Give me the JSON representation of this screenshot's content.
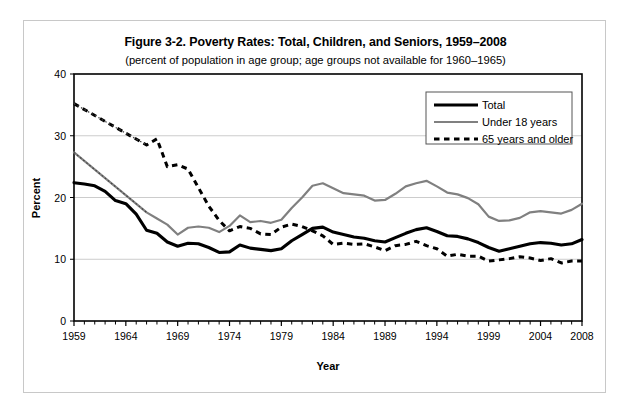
{
  "figure": {
    "title": "Figure 3-2. Poverty Rates: Total, Children, and Seniors, 1959–2008",
    "subtitle": "(percent of population in age group; age groups not available for 1960–1965)"
  },
  "colors": {
    "total": "#000000",
    "under18": "#808080",
    "seniors": "#000000",
    "gridline": "#cccccc",
    "frame": "#000000",
    "outer_border": "#c8c8c8",
    "background": "#ffffff"
  },
  "legend": {
    "position": "top-right",
    "entries": [
      {
        "label": "Total",
        "style": "solid-thick",
        "color": "#000000"
      },
      {
        "label": "Under 18 years",
        "style": "solid",
        "color": "#808080"
      },
      {
        "label": "65 years and older",
        "style": "dashed",
        "color": "#000000"
      }
    ]
  },
  "chart_data": {
    "type": "line",
    "title": "Figure 3-2. Poverty Rates: Total, Children, and Seniors, 1959–2008",
    "subtitle": "(percent of population in age group; age groups not available for 1960–1965)",
    "xlabel": "Year",
    "ylabel": "Percent",
    "xlim": [
      1959,
      2008
    ],
    "ylim": [
      0,
      40
    ],
    "ytick_labels": [
      "0",
      "10",
      "20",
      "30",
      "40"
    ],
    "yticks": [
      0,
      10,
      20,
      30,
      40
    ],
    "xtick_labels": [
      "1959",
      "1964",
      "1969",
      "1974",
      "1979",
      "1984",
      "1989",
      "1994",
      "1999",
      "2004",
      "2008"
    ],
    "xticks": [
      1959,
      1964,
      1969,
      1974,
      1979,
      1984,
      1989,
      1994,
      1999,
      2004,
      2008
    ],
    "xtick_minor_step": 1,
    "grid": "horizontal",
    "x": [
      1959,
      1960,
      1961,
      1962,
      1963,
      1964,
      1965,
      1966,
      1967,
      1968,
      1969,
      1970,
      1971,
      1972,
      1973,
      1974,
      1975,
      1976,
      1977,
      1978,
      1979,
      1980,
      1981,
      1982,
      1983,
      1984,
      1985,
      1986,
      1987,
      1988,
      1989,
      1990,
      1991,
      1992,
      1993,
      1994,
      1995,
      1996,
      1997,
      1998,
      1999,
      2000,
      2001,
      2002,
      2003,
      2004,
      2005,
      2006,
      2007,
      2008
    ],
    "series": [
      {
        "name": "Total",
        "style": "solid-thick",
        "color": "#000000",
        "values": [
          22.4,
          22.2,
          21.9,
          21.0,
          19.5,
          19.0,
          17.3,
          14.7,
          14.2,
          12.8,
          12.1,
          12.6,
          12.5,
          11.9,
          11.1,
          11.2,
          12.3,
          11.8,
          11.6,
          11.4,
          11.7,
          13.0,
          14.0,
          15.0,
          15.2,
          14.4,
          14.0,
          13.6,
          13.4,
          13.0,
          12.8,
          13.5,
          14.2,
          14.8,
          15.1,
          14.5,
          13.8,
          13.7,
          13.3,
          12.7,
          11.9,
          11.3,
          11.7,
          12.1,
          12.5,
          12.7,
          12.6,
          12.3,
          12.5,
          13.2
        ]
      },
      {
        "name": "Under 18 years",
        "style": "solid",
        "color": "#808080",
        "values": [
          27.3,
          null,
          null,
          null,
          null,
          null,
          null,
          17.6,
          16.6,
          15.6,
          14.0,
          15.1,
          15.3,
          15.1,
          14.4,
          15.4,
          17.1,
          16.0,
          16.2,
          15.9,
          16.4,
          18.3,
          20.0,
          21.9,
          22.3,
          21.5,
          20.7,
          20.5,
          20.3,
          19.5,
          19.6,
          20.6,
          21.8,
          22.3,
          22.7,
          21.8,
          20.8,
          20.5,
          19.9,
          18.9,
          16.9,
          16.2,
          16.3,
          16.7,
          17.6,
          17.8,
          17.6,
          17.4,
          18.0,
          19.0
        ]
      },
      {
        "name": "65 years and older",
        "style": "dashed",
        "color": "#000000",
        "values": [
          35.2,
          null,
          null,
          null,
          null,
          null,
          null,
          28.5,
          29.5,
          25.0,
          25.3,
          24.6,
          21.6,
          18.6,
          16.3,
          14.6,
          15.3,
          15.0,
          14.1,
          14.0,
          15.2,
          15.7,
          15.3,
          14.6,
          13.8,
          12.4,
          12.6,
          12.4,
          12.5,
          12.0,
          11.4,
          12.2,
          12.4,
          12.9,
          12.2,
          11.7,
          10.5,
          10.8,
          10.5,
          10.5,
          9.7,
          9.9,
          10.1,
          10.4,
          10.2,
          9.8,
          10.1,
          9.4,
          9.7,
          9.7
        ]
      }
    ],
    "interpolated_segments": [
      {
        "series": "Under 18 years",
        "style": "dotted",
        "from_year": 1959,
        "from_value": 27.3,
        "to_year": 1966,
        "to_value": 17.6
      },
      {
        "series": "65 years and older",
        "style": "dotted",
        "from_year": 1959,
        "from_value": 35.2,
        "to_year": 1966,
        "to_value": 28.5
      }
    ]
  }
}
